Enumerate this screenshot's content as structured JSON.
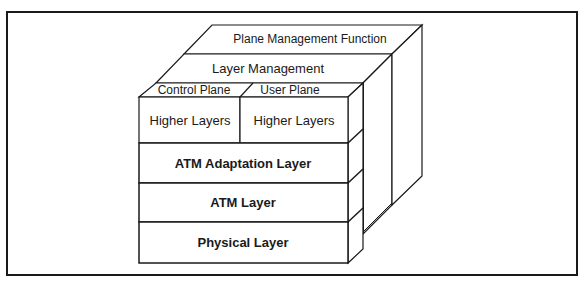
{
  "diagram": {
    "planes": {
      "plane_management": "Plane Management Function",
      "layer_management": "Layer Management",
      "control_plane": "Control Plane",
      "user_plane": "User Plane"
    },
    "layers": [
      {
        "id": "higher-control",
        "label": "Higher Layers"
      },
      {
        "id": "higher-user",
        "label": "Higher Layers"
      },
      {
        "id": "aal",
        "label": "ATM Adaptation Layer"
      },
      {
        "id": "atm",
        "label": "ATM Layer"
      },
      {
        "id": "physical",
        "label": "Physical Layer"
      }
    ],
    "colors": {
      "line": "#1a1a1a",
      "background": "#ffffff"
    }
  }
}
